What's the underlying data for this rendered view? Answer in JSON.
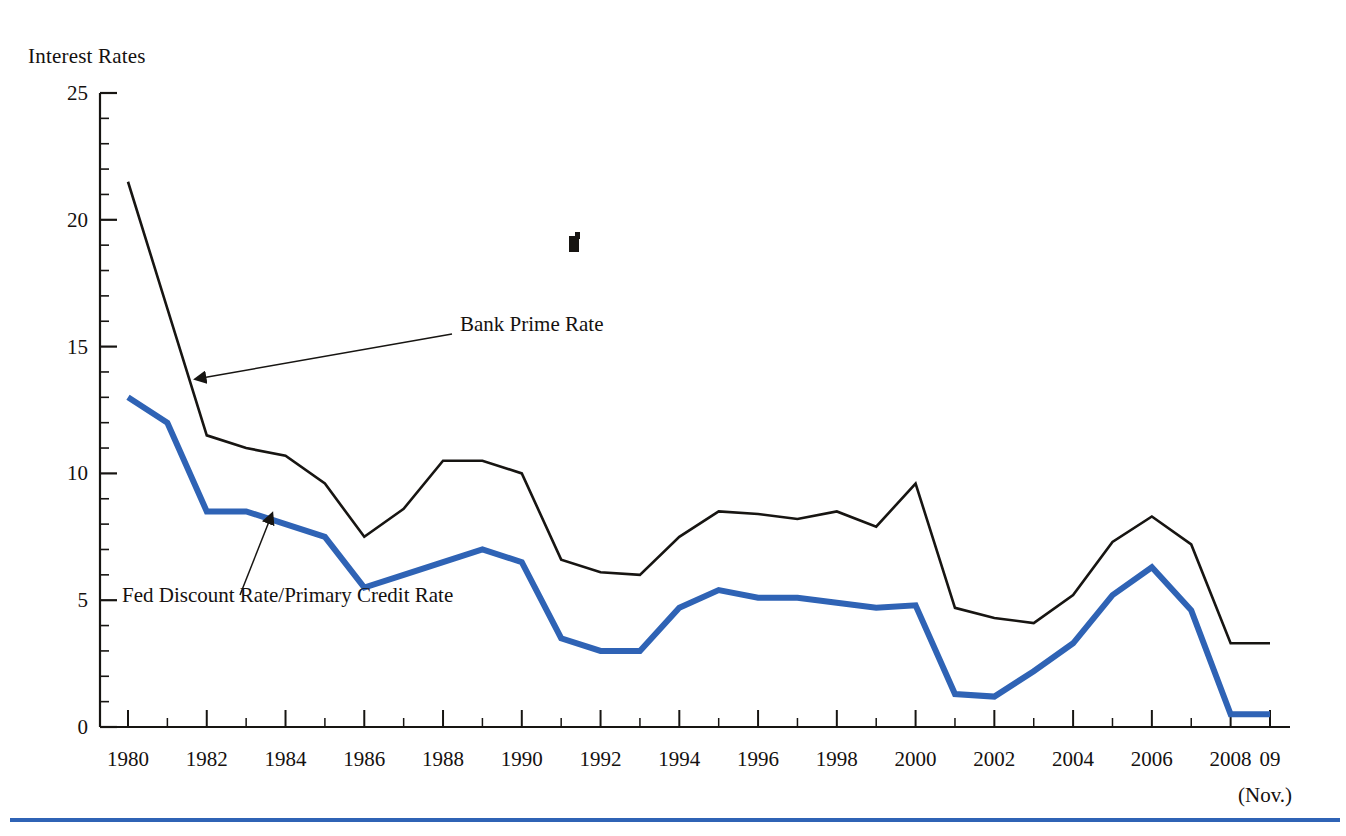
{
  "figure": {
    "y_axis_title": "Interest Rates",
    "x_axis_note": "(Nov.)"
  },
  "annotations": {
    "prime": "Bank Prime Rate",
    "discount": "Fed Discount Rate/Primary Credit Rate"
  },
  "colors": {
    "prime_line": "#171512",
    "discount_line": "#2f63b5",
    "axis": "#171512",
    "rule": "#2f63b5",
    "background": "#ffffff"
  },
  "chart_data": {
    "type": "line",
    "title": "Interest Rates",
    "xlabel": "",
    "ylabel": "Interest Rates",
    "ylim": [
      0,
      25
    ],
    "yticks": [
      0,
      5,
      10,
      15,
      20,
      25
    ],
    "y_minor_tick_step": 1,
    "grid": false,
    "legend": "inline-annotations",
    "x": [
      1980,
      1981,
      1982,
      1983,
      1984,
      1985,
      1986,
      1987,
      1988,
      1989,
      1990,
      1991,
      1992,
      1993,
      1994,
      1995,
      1996,
      1997,
      1998,
      1999,
      2000,
      2001,
      2002,
      2003,
      2004,
      2005,
      2006,
      2007,
      2008,
      2009
    ],
    "xticks": [
      1980,
      1982,
      1984,
      1986,
      1988,
      1990,
      1992,
      1994,
      1996,
      1998,
      2000,
      2002,
      2004,
      2006,
      2008,
      2009
    ],
    "xtick_labels": [
      "1980",
      "1982",
      "1984",
      "1986",
      "1988",
      "1990",
      "1992",
      "1994",
      "1996",
      "1998",
      "2000",
      "2002",
      "2004",
      "2006",
      "2008",
      "09"
    ],
    "series": [
      {
        "name": "Bank Prime Rate",
        "color": "#171512",
        "values": [
          21.5,
          16.5,
          11.5,
          11.0,
          10.7,
          9.6,
          7.5,
          8.6,
          10.5,
          10.5,
          10.0,
          6.6,
          6.1,
          6.0,
          7.5,
          8.5,
          8.4,
          8.2,
          8.5,
          7.9,
          9.6,
          4.7,
          4.3,
          4.1,
          5.2,
          7.3,
          8.3,
          7.2,
          3.3,
          3.3
        ]
      },
      {
        "name": "Fed Discount Rate/Primary Credit Rate",
        "color": "#2f63b5",
        "values": [
          13.0,
          12.0,
          8.5,
          8.5,
          8.0,
          7.5,
          5.5,
          6.0,
          6.5,
          7.0,
          6.5,
          3.5,
          3.0,
          3.0,
          4.7,
          5.4,
          5.1,
          5.1,
          4.9,
          4.7,
          4.8,
          1.3,
          1.2,
          2.2,
          3.3,
          5.2,
          6.3,
          4.6,
          0.5,
          0.5
        ]
      }
    ],
    "annotations": [
      {
        "text": "Bank Prime Rate",
        "points_to_year": 1981,
        "points_to_value": 14.0
      },
      {
        "text": "Fed Discount Rate/Primary Credit Rate",
        "points_to_year": 1984,
        "points_to_value": 8.0
      }
    ]
  }
}
